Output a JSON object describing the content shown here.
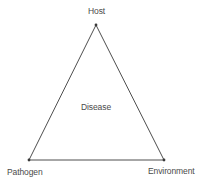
{
  "diagram": {
    "type": "triangle",
    "vertices": {
      "top": "Host",
      "bottom_left": "Pathogen",
      "bottom_right": "Environment"
    },
    "center_label": "Disease",
    "colors": {
      "line": "#3a3a3a",
      "text": "#4a4a4a",
      "background": "#ffffff"
    }
  }
}
